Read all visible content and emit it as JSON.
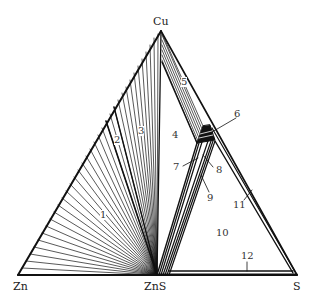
{
  "diagram": {
    "type": "ternary-phase-diagram",
    "vertices": {
      "top": "Cu",
      "left": "Zn",
      "bottom_middle": "ZnS",
      "right": "S"
    },
    "regions": [
      {
        "id": "1",
        "label": "1"
      },
      {
        "id": "2",
        "label": "2"
      },
      {
        "id": "3",
        "label": "3"
      },
      {
        "id": "4",
        "label": "4"
      },
      {
        "id": "5",
        "label": "5"
      },
      {
        "id": "6",
        "label": "6"
      },
      {
        "id": "7",
        "label": "7"
      },
      {
        "id": "8",
        "label": "8"
      },
      {
        "id": "9",
        "label": "9"
      },
      {
        "id": "10",
        "label": "10"
      },
      {
        "id": "11",
        "label": "11"
      },
      {
        "id": "12",
        "label": "12"
      }
    ],
    "colors": {
      "line": "#111111",
      "background": "#ffffff"
    }
  }
}
